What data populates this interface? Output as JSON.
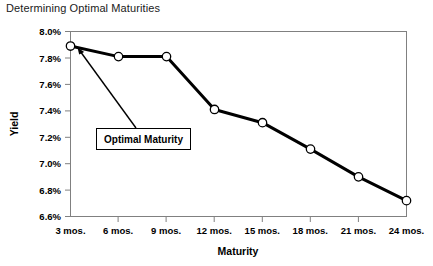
{
  "chart_data": {
    "type": "line",
    "title": "Determining Optimal Maturities",
    "xlabel": "Maturity",
    "ylabel": "Yield",
    "categories": [
      "3 mos.",
      "6 mos.",
      "9 mos.",
      "12 mos.",
      "15 mos.",
      "18 mos.",
      "21 mos.",
      "24 mos."
    ],
    "values": [
      7.89,
      7.81,
      7.81,
      7.41,
      7.31,
      7.11,
      6.9,
      6.72
    ],
    "ylim": [
      6.6,
      8.0
    ],
    "ytick_labels": [
      "8.0%",
      "7.8%",
      "7.6%",
      "7.4%",
      "7.2%",
      "7.0%",
      "6.8%",
      "6.6%"
    ],
    "ytick_values": [
      8.0,
      7.8,
      7.6,
      7.4,
      7.2,
      7.0,
      6.8,
      6.6
    ],
    "grid": false,
    "legend": "none",
    "series_color": "#000000",
    "marker_fill": "#ffffff",
    "marker_edge": "#000000",
    "annotations": [
      {
        "label": "Optimal Maturity",
        "points_to_category": "3 mos."
      }
    ]
  },
  "callout": {
    "label": "Optimal Maturity",
    "border_color": "#000000",
    "background_color": "#ffffff"
  },
  "axes": {
    "frame_color": "#808080",
    "tick_color": "#808080"
  }
}
